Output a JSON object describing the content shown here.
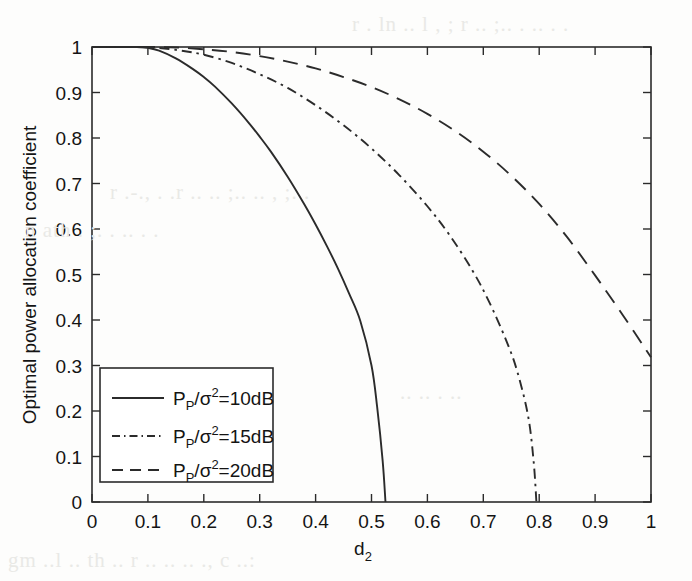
{
  "chart_data": {
    "type": "line",
    "title": "",
    "xlabel": "d_2",
    "xlabel_base": "d",
    "xlabel_sub": "2",
    "ylabel": "Optimal power allocation coefficient",
    "xlim": [
      0,
      1
    ],
    "ylim": [
      0,
      1
    ],
    "xticks": [
      "0",
      "0.1",
      "0.2",
      "0.3",
      "0.4",
      "0.5",
      "0.6",
      "0.7",
      "0.8",
      "0.9",
      "1"
    ],
    "xtick_values": [
      0,
      0.1,
      0.2,
      0.3,
      0.4,
      0.5,
      0.6,
      0.7,
      0.8,
      0.9,
      1
    ],
    "yticks": [
      "0",
      "0.1",
      "0.2",
      "0.3",
      "0.4",
      "0.5",
      "0.6",
      "0.7",
      "0.8",
      "0.9",
      "1"
    ],
    "ytick_values": [
      0,
      0.1,
      0.2,
      0.3,
      0.4,
      0.5,
      0.6,
      0.7,
      0.8,
      0.9,
      1
    ],
    "grid": false,
    "legend_position": "lower left",
    "series": [
      {
        "name": "P_P/sigma^2=10dB",
        "label_p": "P",
        "label_p_sub": "P",
        "label_slash": "/",
        "label_sigma": "σ",
        "label_sigma_sup": "2",
        "label_tail": "=10dB",
        "style": "solid",
        "x": [
          0.0,
          0.05,
          0.08,
          0.1,
          0.12,
          0.15,
          0.18,
          0.2,
          0.22,
          0.25,
          0.28,
          0.3,
          0.32,
          0.35,
          0.38,
          0.4,
          0.42,
          0.44,
          0.46,
          0.48,
          0.5,
          0.51,
          0.52,
          0.525
        ],
        "y": [
          1.0,
          1.0,
          1.0,
          0.998,
          0.992,
          0.975,
          0.952,
          0.934,
          0.913,
          0.876,
          0.834,
          0.803,
          0.77,
          0.715,
          0.654,
          0.61,
          0.563,
          0.513,
          0.458,
          0.398,
          0.3,
          0.21,
          0.09,
          0.0
        ]
      },
      {
        "name": "P_P/sigma^2=15dB",
        "label_p": "P",
        "label_p_sub": "P",
        "label_slash": "/",
        "label_sigma": "σ",
        "label_sigma_sup": "2",
        "label_tail": "=15dB",
        "style": "dashdot",
        "x": [
          0.0,
          0.08,
          0.12,
          0.16,
          0.2,
          0.25,
          0.3,
          0.35,
          0.4,
          0.45,
          0.5,
          0.55,
          0.6,
          0.64,
          0.68,
          0.71,
          0.74,
          0.76,
          0.78,
          0.79,
          0.795
        ],
        "y": [
          1.0,
          1.0,
          0.998,
          0.992,
          0.983,
          0.965,
          0.94,
          0.91,
          0.872,
          0.828,
          0.777,
          0.718,
          0.65,
          0.586,
          0.51,
          0.441,
          0.358,
          0.29,
          0.19,
          0.09,
          0.0
        ]
      },
      {
        "name": "P_P/sigma^2=20dB",
        "label_p": "P",
        "label_p_sub": "P",
        "label_slash": "/",
        "label_sigma": "σ",
        "label_sigma_sup": "2",
        "label_tail": "=20dB",
        "style": "dashed",
        "x": [
          0.0,
          0.1,
          0.15,
          0.2,
          0.25,
          0.3,
          0.35,
          0.4,
          0.45,
          0.5,
          0.55,
          0.6,
          0.65,
          0.7,
          0.75,
          0.8,
          0.85,
          0.9,
          0.95,
          1.0
        ],
        "y": [
          1.0,
          1.0,
          0.999,
          0.995,
          0.989,
          0.98,
          0.968,
          0.953,
          0.934,
          0.912,
          0.885,
          0.853,
          0.815,
          0.77,
          0.717,
          0.655,
          0.582,
          0.498,
          0.41,
          0.318
        ]
      }
    ]
  },
  "legend": {
    "entries": [
      {
        "text": "P_P/σ²=10dB",
        "style": "solid"
      },
      {
        "text": "P_P/σ²=15dB",
        "style": "dashdot"
      },
      {
        "text": "P_P/σ²=20dB",
        "style": "dashed"
      }
    ]
  },
  "colors": {
    "line": "#2b2b2b",
    "axis": "#2b2b2b",
    "text": "#141414",
    "background": "#fdfdfc"
  },
  "background_bleed": [
    "r  .    ln   ..  l   ,   ;   r  ..  ;..  .  ..   . .",
    "r  .-.,    . .r ..  ..   ;..   ..     ,  ;.  .",
    "n  ath    .     ;.   .  ..     .   .",
    "..  ..     .    ..",
    "gm  ..l ..  th   ..  r   ..  ..  .. ., c  ..:"
  ]
}
